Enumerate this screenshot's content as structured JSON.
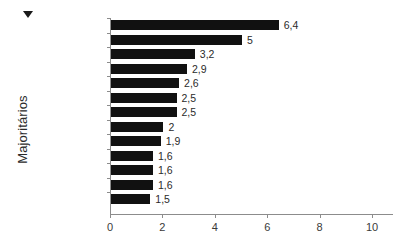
{
  "chart_data": {
    "type": "bar",
    "orientation": "horizontal",
    "title": "",
    "xlabel": "",
    "ylabel": "Majoritários",
    "categories": [
      "Vanuatu",
      "Índia",
      "Canadá",
      "Zâmbia",
      "Reino Unido",
      "França",
      "Austrália",
      "Bahamas",
      "Estados Unidos",
      "Jamaica",
      "Tanzânia",
      "Botsuana",
      "Belize"
    ],
    "values": [
      6.4,
      5,
      3.2,
      2.9,
      2.6,
      2.5,
      2.5,
      2,
      1.9,
      1.6,
      1.6,
      1.6,
      1.5
    ],
    "value_labels": [
      "6,4",
      "5",
      "3,2",
      "2,9",
      "2,6",
      "2,5",
      "2,5",
      "2",
      "1,9",
      "1,6",
      "1,6",
      "1,6",
      "1,5"
    ],
    "xlim": [
      0,
      10
    ],
    "xticks": [
      0,
      2,
      4,
      6,
      8,
      10
    ],
    "xtick_labels": [
      "0",
      "2",
      "4",
      "6",
      "8",
      "10"
    ],
    "grid": false,
    "legend": false,
    "bar_color": "#111111",
    "axis_color": "#8c8c8c",
    "text_color": "#2b2b2b",
    "background_color": "#ffffff"
  },
  "marker": {
    "name": "down-triangle-marker"
  }
}
